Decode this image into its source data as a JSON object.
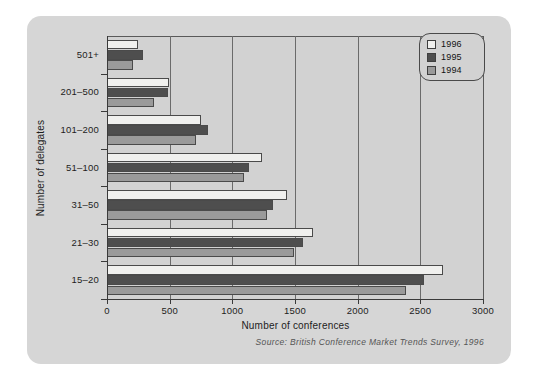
{
  "chart_data": {
    "type": "bar",
    "orientation": "horizontal",
    "title": "",
    "xlabel": "Number of conferences",
    "ylabel": "Number of delegates",
    "categories": [
      "501+",
      "201–500",
      "101–200",
      "51–100",
      "31–50",
      "21–30",
      "15–20"
    ],
    "series": [
      {
        "name": "1996",
        "color": "#f0f0ee",
        "values": [
          250,
          495,
          750,
          1235,
          1440,
          1640,
          2680
        ]
      },
      {
        "name": "1995",
        "color": "#4e4e4e",
        "values": [
          290,
          485,
          805,
          1130,
          1325,
          1560,
          2530
        ]
      },
      {
        "name": "1994",
        "color": "#9a9a9a",
        "values": [
          205,
          375,
          710,
          1090,
          1275,
          1490,
          2385
        ]
      }
    ],
    "xlim": [
      0,
      3000
    ],
    "xticks": [
      0,
      500,
      1000,
      1500,
      2000,
      2500,
      3000
    ],
    "xticklabels": [
      "0",
      "500",
      "1000",
      "1500",
      "2000",
      "2500",
      "3000"
    ],
    "grid": "vertical",
    "legend_position": "top-right",
    "legend_entries": [
      "1996",
      "1995",
      "1994"
    ],
    "source_note": "Source: British Conference Market Trends Survey, 1996"
  },
  "colors": {
    "panel_background": "#d6d6d6",
    "plot_background": "#d2d2d2",
    "axis": "#3a3a3a",
    "gridline": "#6b6b6b",
    "text": "#1d1d1d",
    "source_text": "#555555"
  }
}
